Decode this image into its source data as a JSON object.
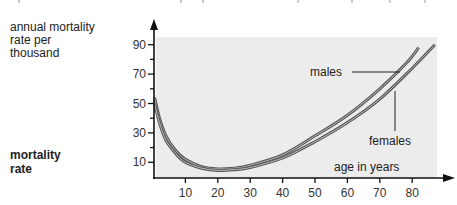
{
  "figure": {
    "y_label": "annual mortality rate per thousand",
    "y_label_lines": [
      "annual mortality",
      "rate per",
      "thousand"
    ],
    "side_title_lines": [
      "mortality",
      "rate"
    ],
    "x_label": "age in years",
    "annotations": {
      "males": "males",
      "females": "females"
    },
    "colors": {
      "plot_bg": "#ececec",
      "curve": "#555555",
      "axis": "#111111"
    }
  },
  "chart_data": {
    "type": "line",
    "title": "mortality rate",
    "xlabel": "age in years",
    "ylabel": "annual mortality rate per thousand",
    "x_ticks": [
      10,
      20,
      30,
      40,
      50,
      60,
      70,
      80
    ],
    "y_ticks": [
      10,
      30,
      50,
      70,
      90
    ],
    "xlim": [
      0,
      88
    ],
    "ylim": [
      0,
      95
    ],
    "grid": false,
    "legend": "inline annotations",
    "series": [
      {
        "name": "males",
        "x": [
          0.5,
          2,
          4,
          7,
          10,
          15,
          20,
          25,
          30,
          40,
          50,
          60,
          70,
          78,
          82
        ],
        "y": [
          54,
          40,
          28,
          18,
          12,
          7,
          5.5,
          6,
          8,
          15,
          28,
          42,
          60,
          77,
          88
        ]
      },
      {
        "name": "females",
        "x": [
          0.5,
          2,
          4,
          7,
          10,
          15,
          20,
          25,
          30,
          40,
          50,
          60,
          70,
          80,
          87
        ],
        "y": [
          50,
          37,
          25,
          16,
          10,
          6,
          4.5,
          5,
          6.5,
          13,
          24,
          37,
          53,
          74,
          90
        ]
      }
    ]
  }
}
